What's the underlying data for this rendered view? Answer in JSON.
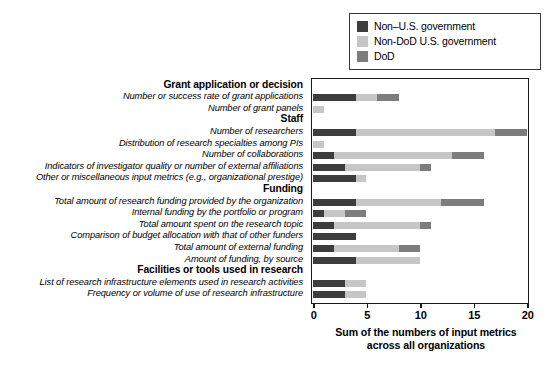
{
  "legend": {
    "position": "top-right",
    "entries": [
      {
        "label": "Non–U.S. government",
        "color": "#3d3d3d",
        "icon": "legend-swatch"
      },
      {
        "label": "Non-DoD U.S. government",
        "color": "#c6c6c6",
        "icon": "legend-swatch"
      },
      {
        "label": "DoD",
        "color": "#7d7d7d",
        "icon": "legend-swatch"
      }
    ]
  },
  "axis": {
    "ticks": [
      "0",
      "5",
      "10",
      "15",
      "20"
    ],
    "title_line1": "Sum of the numbers of input metrics",
    "title_line2": "across all organizations"
  },
  "chart_data": {
    "type": "bar",
    "orientation": "horizontal",
    "stacked": true,
    "title": "",
    "xlabel": "Sum of the numbers of input metrics across all organizations",
    "ylabel": "",
    "xlim": [
      0,
      20
    ],
    "xticks": [
      0,
      5,
      10,
      15,
      20
    ],
    "grid": false,
    "legend_position": "top-right",
    "series": [
      {
        "name": "Non–U.S. government",
        "color": "#3d3d3d"
      },
      {
        "name": "Non-DoD U.S. government",
        "color": "#c6c6c6"
      },
      {
        "name": "DoD",
        "color": "#7d7d7d"
      }
    ],
    "rows": [
      {
        "type": "group",
        "label": "Grant application or decision"
      },
      {
        "type": "bar",
        "label": "Number or success rate of grant applications",
        "values": [
          4,
          2,
          2
        ],
        "total": 8
      },
      {
        "type": "bar",
        "label": "Number of grant panels",
        "values": [
          0,
          1,
          0
        ],
        "total": 1
      },
      {
        "type": "group",
        "label": "Staff"
      },
      {
        "type": "bar",
        "label": "Number of researchers",
        "values": [
          4,
          13,
          3
        ],
        "total": 20
      },
      {
        "type": "bar",
        "label": "Distribution of research specialties among PIs",
        "values": [
          0,
          1,
          0
        ],
        "total": 1
      },
      {
        "type": "bar",
        "label": "Number of collaborations",
        "values": [
          2,
          11,
          3
        ],
        "total": 16
      },
      {
        "type": "bar",
        "label": "Indicators of investigator quality or number of external affiliations",
        "values": [
          3,
          7,
          1
        ],
        "total": 11
      },
      {
        "type": "bar",
        "label": "Other or miscellaneous input metrics (e.g., organizational prestige)",
        "values": [
          4,
          1,
          0
        ],
        "total": 5
      },
      {
        "type": "group",
        "label": "Funding"
      },
      {
        "type": "bar",
        "label": "Total amount of research funding provided by the organization",
        "values": [
          4,
          8,
          4
        ],
        "total": 16
      },
      {
        "type": "bar",
        "label": "Internal funding by the portfolio or program",
        "values": [
          1,
          2,
          2
        ],
        "total": 5
      },
      {
        "type": "bar",
        "label": "Total amount spent on the research topic",
        "values": [
          2,
          8,
          1
        ],
        "total": 11
      },
      {
        "type": "bar",
        "label": "Comparison of budget allocation with that of other funders",
        "values": [
          4,
          0,
          0
        ],
        "total": 4
      },
      {
        "type": "bar",
        "label": "Total amount of external funding",
        "values": [
          2,
          6,
          2
        ],
        "total": 10
      },
      {
        "type": "bar",
        "label": "Amount of funding, by source",
        "values": [
          4,
          6,
          0
        ],
        "total": 10
      },
      {
        "type": "group",
        "label": "Facilities or tools used in research"
      },
      {
        "type": "bar",
        "label": "List of research infrastructure elements used in research activities",
        "values": [
          3,
          2,
          0
        ],
        "total": 5
      },
      {
        "type": "bar",
        "label": "Frequency or volume of use of research infrastructure",
        "values": [
          3,
          2,
          0
        ],
        "total": 5
      }
    ]
  }
}
